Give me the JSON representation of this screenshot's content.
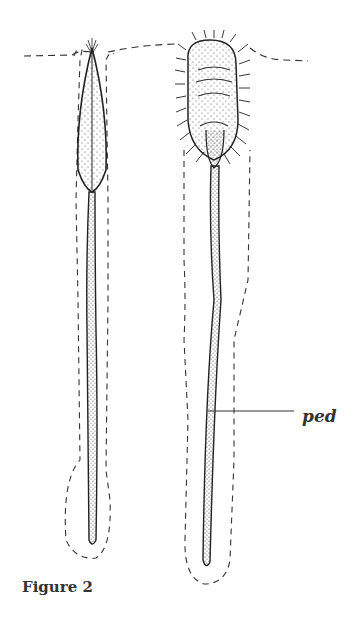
{
  "figure": {
    "caption": "Figure 2",
    "labels": {
      "ped": "ped"
    },
    "specimens": [
      {
        "name": "left-specimen",
        "description": "narrow closed capsule on long stalk"
      },
      {
        "name": "right-specimen",
        "description": "hairy oval head on long stalk"
      }
    ]
  }
}
